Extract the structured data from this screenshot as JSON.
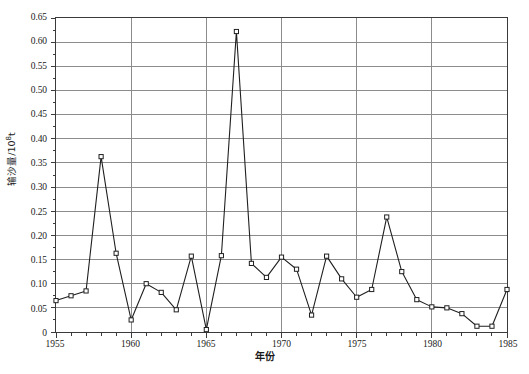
{
  "chart_data": {
    "type": "line",
    "title": "",
    "xlabel": "年份",
    "ylabel": "输沙量/10⁸t",
    "ylabel_main": "输沙量/10",
    "ylabel_exponent": "8",
    "ylabel_unit": "t",
    "xlim": [
      1955,
      1985
    ],
    "ylim": [
      0,
      0.65
    ],
    "ytick_step": 0.05,
    "xtick_major_step": 5,
    "xtick_minor_step": 1,
    "grid": true,
    "grid_axis": "y-and-x-major",
    "legend": null,
    "marker": "open-square",
    "line_color": "#1f1f1f",
    "grid_color": "#8c8c8c",
    "frame_color": "#3a3a3a",
    "background": "#ffffff",
    "x": [
      1955,
      1956,
      1957,
      1958,
      1959,
      1960,
      1961,
      1962,
      1963,
      1964,
      1965,
      1966,
      1967,
      1968,
      1969,
      1970,
      1971,
      1972,
      1973,
      1974,
      1975,
      1976,
      1977,
      1978,
      1979,
      1980,
      1981,
      1982,
      1983,
      1984,
      1985
    ],
    "values": [
      0.065,
      0.075,
      0.085,
      0.363,
      0.163,
      0.025,
      0.1,
      0.082,
      0.046,
      0.157,
      0.005,
      0.158,
      0.622,
      0.142,
      0.113,
      0.155,
      0.13,
      0.035,
      0.157,
      0.11,
      0.072,
      0.088,
      0.238,
      0.125,
      0.067,
      0.052,
      0.05,
      0.038,
      0.012,
      0.012,
      0.088
    ],
    "ytick_labels": [
      "0.65",
      "0.60",
      "0.55",
      "0.50",
      "0.45",
      "0.40",
      "0.35",
      "0.30",
      "0.25",
      "0.20",
      "0.15",
      "0.10",
      "0.05",
      "0"
    ],
    "ytick_values": [
      0.65,
      0.6,
      0.55,
      0.5,
      0.45,
      0.4,
      0.35,
      0.3,
      0.25,
      0.2,
      0.15,
      0.1,
      0.05,
      0
    ],
    "xtick_labels": [
      "1955",
      "1960",
      "1965",
      "1970",
      "1975",
      "1980",
      "1985"
    ],
    "xtick_values": [
      1955,
      1960,
      1965,
      1970,
      1975,
      1980,
      1985
    ]
  },
  "caption": ""
}
